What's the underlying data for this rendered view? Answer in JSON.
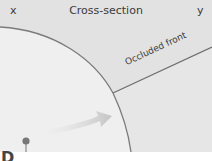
{
  "diagram": {
    "title": "Cross-section",
    "left_label": "x",
    "right_label": "y",
    "front_label": "Occluded front",
    "panel_letter": "D",
    "colors": {
      "background": "#e6e6e6",
      "cold_region": "#efefef",
      "upper_region": "#e2e2e2",
      "line": "#7a7a7a",
      "arrow": "#c8c8c8",
      "pin": "#777777"
    }
  }
}
